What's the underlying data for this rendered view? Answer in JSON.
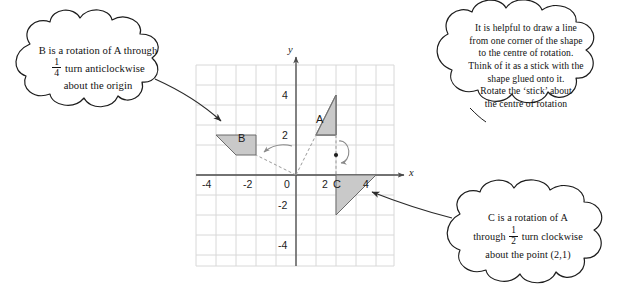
{
  "figure": {
    "grid": {
      "x_ticks": [
        "-4",
        "-2",
        "0",
        "2",
        "4"
      ],
      "y_ticks": [
        "4",
        "2",
        "-2",
        "-4"
      ],
      "x_axis_name": "x",
      "y_axis_name": "y",
      "x_range": [
        -5,
        5
      ],
      "y_range": [
        -5,
        5
      ],
      "origin_label": "0"
    },
    "shapes": [
      {
        "id": "A",
        "label": "A",
        "fill": "#c9c9c9",
        "stroke": "#6b6b6b",
        "points": [
          [
            1,
            2
          ],
          [
            2,
            4
          ],
          [
            2,
            2
          ],
          [
            1,
            2
          ]
        ]
      },
      {
        "id": "B",
        "label": "B",
        "fill": "#c9c9c9",
        "stroke": "#6b6b6b",
        "points": [
          [
            -4,
            2
          ],
          [
            -2,
            2
          ],
          [
            -2,
            1
          ],
          [
            -3,
            1
          ]
        ]
      },
      {
        "id": "C",
        "label": "C",
        "fill": "#c9c9c9",
        "stroke": "#6b6b6b",
        "points": [
          [
            2,
            0
          ],
          [
            4,
            0
          ],
          [
            3,
            -1
          ],
          [
            2,
            -2
          ]
        ]
      }
    ],
    "centres_of_rotation": [
      {
        "label": "origin",
        "point": [
          0,
          0
        ]
      },
      {
        "label": "(2,1)",
        "point": [
          2,
          1
        ]
      }
    ],
    "shape_labels": {
      "a": "A",
      "b": "B",
      "c": "C"
    }
  },
  "clouds": {
    "left": {
      "line1": "B is a rotation of A through",
      "frac_num": "1",
      "frac_den": "4",
      "line2": "turn anticlockwise",
      "line3": "about the origin"
    },
    "top_right": {
      "line1": "It is helpful to draw a line",
      "line2": "from one corner of the shape",
      "line3": "to the centre of rotation.",
      "line4": "Think of it as a stick with the",
      "line5": "shape glued onto it.",
      "line6": "Rotate the ‘stick’ about",
      "line7": "the centre of rotation"
    },
    "bottom_right": {
      "line1": "C is a rotation of A",
      "line2_pre": "through",
      "frac_num": "1",
      "frac_den": "2",
      "line2_post": "turn clockwise",
      "line3": "about the point (2,1)"
    }
  },
  "colors": {
    "shape_fill": "#c9c9c9",
    "shape_stroke": "#6b6b6b",
    "grid_line": "#d2d2d2",
    "axis_line": "#4a4a4a",
    "cloud_stroke": "#1d1d1d",
    "ink": "#111111"
  }
}
